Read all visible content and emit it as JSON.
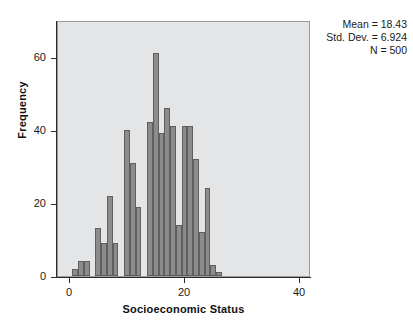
{
  "figure": {
    "background": "#ffffff",
    "plot_background": "#e3e5e6",
    "bar_fill": "#8c8c8c",
    "bar_stroke": "#5f5f5f"
  },
  "annotation": {
    "mean_line": "Mean = 18.43",
    "stddev_line": "Std. Dev. = 6.924",
    "n_line": "N = 500"
  },
  "chart_data": {
    "type": "bar",
    "title": "",
    "subtitle": "",
    "xlabel": "Socioeconomic Status",
    "ylabel": "Frequency",
    "xlim": [
      -2,
      42
    ],
    "ylim": [
      0,
      70
    ],
    "xticks": [
      0,
      20,
      40
    ],
    "xtick_labels": [
      "0",
      "20",
      "40"
    ],
    "yticks": [
      0,
      20,
      40,
      60
    ],
    "ytick_labels": [
      "0",
      "20",
      "40",
      "60"
    ],
    "grid": false,
    "legend": null,
    "bin_width": 1,
    "categories": [
      1,
      2,
      3,
      4,
      5,
      6,
      7,
      8,
      9,
      10,
      11,
      12,
      13,
      14,
      15,
      16,
      17,
      18,
      19,
      20,
      21,
      22,
      23,
      24,
      25,
      26,
      27,
      28,
      29,
      30,
      31,
      32,
      33,
      34
    ],
    "values": [
      2,
      4,
      4,
      0,
      13,
      9,
      22,
      9,
      0,
      40,
      31,
      19,
      0,
      42,
      61,
      39,
      46,
      41,
      14,
      41,
      41,
      32,
      12,
      24,
      3,
      1,
      0,
      0,
      0,
      0,
      0,
      0,
      0,
      0
    ],
    "bars": [
      {
        "x": 1,
        "value": 2
      },
      {
        "x": 2,
        "value": 4
      },
      {
        "x": 3,
        "value": 4
      },
      {
        "x": 5,
        "value": 13
      },
      {
        "x": 6,
        "value": 9
      },
      {
        "x": 7,
        "value": 22
      },
      {
        "x": 8,
        "value": 9
      },
      {
        "x": 10,
        "value": 40
      },
      {
        "x": 11,
        "value": 31
      },
      {
        "x": 12,
        "value": 19
      },
      {
        "x": 14,
        "value": 42
      },
      {
        "x": 15,
        "value": 61
      },
      {
        "x": 16,
        "value": 39
      },
      {
        "x": 17,
        "value": 46
      },
      {
        "x": 18,
        "value": 41
      },
      {
        "x": 19,
        "value": 14
      },
      {
        "x": 20,
        "value": 41
      },
      {
        "x": 21,
        "value": 41
      },
      {
        "x": 22,
        "value": 32
      },
      {
        "x": 23,
        "value": 12
      },
      {
        "x": 24,
        "value": 24
      },
      {
        "x": 25,
        "value": 3
      },
      {
        "x": 26,
        "value": 1
      }
    ],
    "statistics": {
      "mean": 18.43,
      "std_dev": 6.924,
      "n": 500
    }
  }
}
